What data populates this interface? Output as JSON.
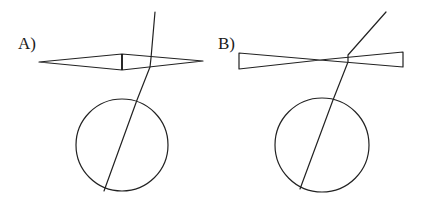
{
  "diagram": {
    "panels": [
      {
        "id": "A",
        "label": "A)",
        "optic": "converging (biconvex) lens drawn as rhombus with center line",
        "ray": "refracted ray passing through lens toward circle (eye)",
        "circle": "eye"
      },
      {
        "id": "B",
        "label": "B)",
        "optic": "diverging (biconcave) lens drawn as bowtie shape",
        "ray": "refracted ray passing through lens toward circle (eye)",
        "circle": "eye"
      }
    ],
    "colors": {
      "line": "#222222",
      "background": "#ffffff"
    }
  }
}
